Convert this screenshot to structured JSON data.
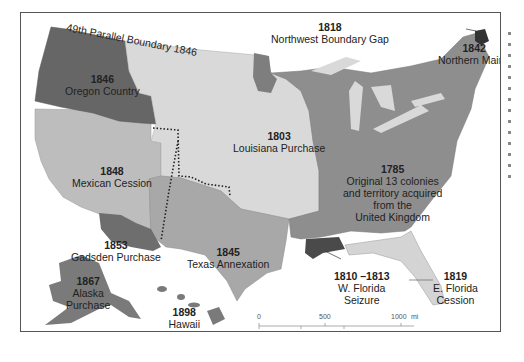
{
  "map": {
    "title_arc": "49th Parallel Boundary 1846",
    "colors": {
      "original": "#8e8e8e",
      "louisiana": "#d9d9d9",
      "oregon": "#666666",
      "mexican": "#bdbdbd",
      "texas": "#a8a8a8",
      "gadsden": "#6e6e6e",
      "alaska": "#7a7a7a",
      "hawaii": "#7a7a7a",
      "west_florida": "#4a4a4a",
      "east_florida": "#d4d4d4",
      "northern_maine": "#333333",
      "nw_gap": "#7e7e7e",
      "lakes": "#d9d9d9"
    },
    "regions": [
      {
        "year": "1846",
        "name": "Oregon Country"
      },
      {
        "year": "1818",
        "name": "Northwest Boundary Gap"
      },
      {
        "year": "1842",
        "name": "Northern Maine"
      },
      {
        "year": "1803",
        "name": "Louisiana Purchase"
      },
      {
        "year": "1848",
        "name": "Mexican Cession"
      },
      {
        "year": "1785",
        "name": "Original 13 colonies and territory acquired from the United Kingdom",
        "lines": [
          "Original 13 colonies",
          "and territory acquired",
          "from the",
          "United Kingdom"
        ]
      },
      {
        "year": "1853",
        "name": "Gadsden Purchase"
      },
      {
        "year": "1845",
        "name": "Texas Annexation"
      },
      {
        "year": "1867",
        "name": "Alaska Purchase",
        "lines": [
          "Alaska",
          "Purchase"
        ]
      },
      {
        "year": "1898",
        "name": "Hawaii Annexation",
        "lines": [
          "Hawaii",
          "Annexation"
        ]
      },
      {
        "year": "1810 –1813",
        "name": "W. Florida Seizure",
        "lines": [
          "W. Florida",
          "Seizure"
        ]
      },
      {
        "year": "1819",
        "name": "E. Florida Cession",
        "lines": [
          "E. Florida",
          "Cession"
        ]
      }
    ],
    "scale": {
      "mi": {
        "ticks": [
          "0",
          "500",
          "1000"
        ],
        "unit": "mi"
      },
      "km": {
        "ticks": [
          "0",
          "500",
          "1000"
        ],
        "unit": "km"
      }
    }
  }
}
